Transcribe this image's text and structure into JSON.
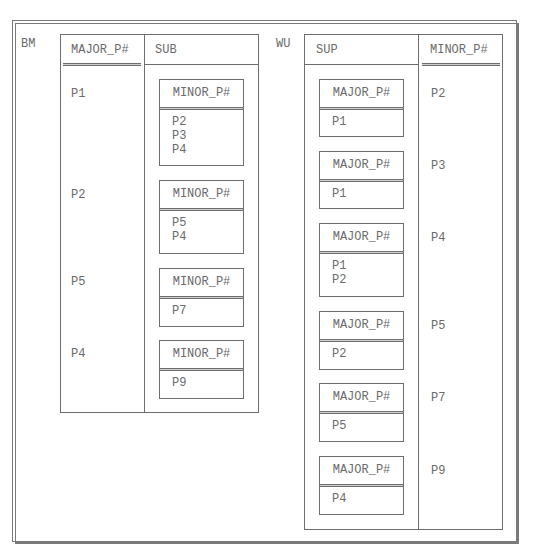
{
  "left_relation": {
    "name": "BM",
    "columns": [
      "MAJOR_P#",
      "SUB"
    ],
    "key_column": "MAJOR_P#",
    "rows": [
      {
        "major": "P1",
        "sub": {
          "header": "MINOR_P#",
          "values": [
            "P2",
            "P3",
            "P4"
          ]
        }
      },
      {
        "major": "P2",
        "sub": {
          "header": "MINOR_P#",
          "values": [
            "P5",
            "P4"
          ]
        }
      },
      {
        "major": "P5",
        "sub": {
          "header": "MINOR_P#",
          "values": [
            "P7"
          ]
        }
      },
      {
        "major": "P4",
        "sub": {
          "header": "MINOR_P#",
          "values": [
            "P9"
          ]
        }
      }
    ]
  },
  "right_relation": {
    "name": "WU",
    "columns": [
      "SUP",
      "MINOR_P#"
    ],
    "key_column": "MINOR_P#",
    "rows": [
      {
        "sup": {
          "header": "MAJOR_P#",
          "values": [
            "P1"
          ]
        },
        "minor": "P2"
      },
      {
        "sup": {
          "header": "MAJOR_P#",
          "values": [
            "P1"
          ]
        },
        "minor": "P3"
      },
      {
        "sup": {
          "header": "MAJOR_P#",
          "values": [
            "P1",
            "P2"
          ]
        },
        "minor": "P4"
      },
      {
        "sup": {
          "header": "MAJOR_P#",
          "values": [
            "P2"
          ]
        },
        "minor": "P5"
      },
      {
        "sup": {
          "header": "MAJOR_P#",
          "values": [
            "P5"
          ]
        },
        "minor": "P7"
      },
      {
        "sup": {
          "header": "MAJOR_P#",
          "values": [
            "P4"
          ]
        },
        "minor": "P9"
      }
    ]
  },
  "colors": {
    "line": "#6e6e6e",
    "text": "#6a6a6a",
    "background": "#ffffff"
  }
}
